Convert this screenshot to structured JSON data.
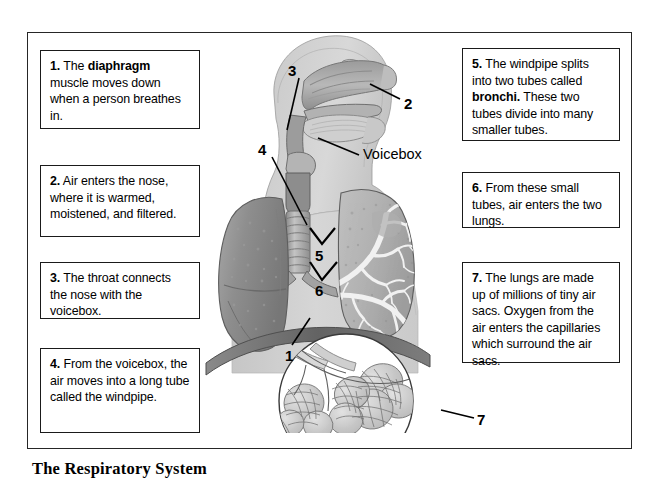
{
  "title": "The Respiratory System",
  "boxes": [
    {
      "id": "box-1",
      "number": "1.",
      "text_before": "The ",
      "bold": "diaphragm",
      "text_after": " muscle moves down when a person breathes in.",
      "full": "1.  The diaphragm muscle moves down when a person breathes in."
    },
    {
      "id": "box-2",
      "number": "2.",
      "text_before": "Air enters the nose, where it is warmed, moistened, and filtered.",
      "bold": "",
      "text_after": "",
      "full": "2.  Air enters the nose, where it is warmed, moistened, and filtered."
    },
    {
      "id": "box-3",
      "number": "3.",
      "text_before": "The throat connects the nose with the voicebox.",
      "bold": "",
      "text_after": "",
      "full": "3.  The throat connects the nose with the voicebox."
    },
    {
      "id": "box-4",
      "number": "4.",
      "text_before": "From the voicebox, the air moves into a long tube called the windpipe.",
      "bold": "",
      "text_after": "",
      "full": "4.  From the voicebox, the air moves into a long tube called the windpipe."
    },
    {
      "id": "box-5",
      "number": "5.",
      "text_before": "The windpipe splits into two tubes called ",
      "bold": "bronchi.",
      "text_after": " These two tubes divide into many smaller tubes.",
      "full": "5.  The windpipe splits into two tubes called bronchi. These two tubes divide into many smaller tubes."
    },
    {
      "id": "box-6",
      "number": "6.",
      "text_before": "From these small tubes, air enters the two lungs.",
      "bold": "",
      "text_after": "",
      "full": "6.  From these small tubes, air enters the two lungs."
    },
    {
      "id": "box-7",
      "number": "7.",
      "text_before": "The lungs are made up of millions of tiny air sacs. Oxygen from the air enters the capillaries which surround the air sacs.",
      "bold": "",
      "text_after": "",
      "full": "7.  The lungs are made up of millions of tiny air sacs. Oxygen from the air enters the capillaries which surround the air sacs."
    }
  ],
  "callouts": [
    {
      "name": "callout-1",
      "label": "1",
      "points_to": "diaphragm"
    },
    {
      "name": "callout-2",
      "label": "2",
      "points_to": "nose"
    },
    {
      "name": "callout-3",
      "label": "3",
      "points_to": "throat"
    },
    {
      "name": "callout-4",
      "label": "4",
      "points_to": "windpipe"
    },
    {
      "name": "callout-5",
      "label": "5",
      "points_to": "bronchi"
    },
    {
      "name": "callout-6",
      "label": "6",
      "points_to": "smaller-tubes"
    },
    {
      "name": "callout-7",
      "label": "7",
      "points_to": "air-sacs"
    },
    {
      "name": "callout-voicebox",
      "label": "Voicebox",
      "points_to": "voicebox"
    }
  ],
  "colors": {
    "frame": "#262626",
    "box_border": "#1a1a1a",
    "body_silhouette": "#d2d2d2",
    "lung_left": "#8d8d8d",
    "lung_right": "#b5b5b5",
    "airway": "#9a9a9a",
    "diaphragm": "#6e6e6e",
    "background": "#ffffff",
    "text": "#000000"
  }
}
